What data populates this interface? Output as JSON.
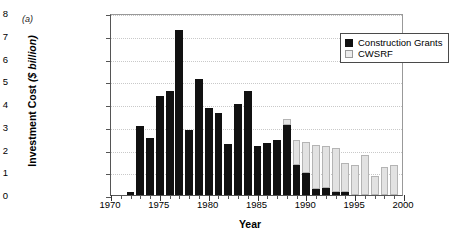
{
  "panel_label": "(a)",
  "legend": {
    "position": "top-right",
    "entries": [
      {
        "label": "Construction Grants",
        "color": "#111111",
        "swatch": "grants"
      },
      {
        "label": "CWSRF",
        "color": "#ececec",
        "swatch": "cwsrf"
      }
    ]
  },
  "axis": {
    "y_title_main": "Investment Cost",
    "y_title_unit": "($ billion)",
    "x_title": "Year"
  },
  "chart_data": {
    "type": "bar",
    "subtype": "stacked-vertical",
    "title": "",
    "xlabel": "Year",
    "ylabel": "Investment Cost ($ billion)",
    "xlim": [
      1970,
      2000
    ],
    "ylim": [
      0,
      8
    ],
    "ytick_labels": [
      "0",
      "1",
      "2",
      "3",
      "4",
      "5",
      "6",
      "7",
      "8"
    ],
    "ytick_values": [
      0,
      1,
      2,
      3,
      4,
      5,
      6,
      7,
      8
    ],
    "xtick_labels": [
      "1970",
      "1975",
      "1980",
      "1985",
      "1990",
      "1995",
      "2000"
    ],
    "xtick_values": [
      1970,
      1975,
      1980,
      1985,
      1990,
      1995,
      2000
    ],
    "x_minor_tick_step": 1,
    "grid": "horizontal-dotted",
    "legend_position": "upper right",
    "categories": [
      1972,
      1973,
      1974,
      1975,
      1976,
      1977,
      1978,
      1979,
      1980,
      1981,
      1982,
      1983,
      1984,
      1985,
      1986,
      1987,
      1988,
      1989,
      1990,
      1991,
      1992,
      1993,
      1994,
      1995,
      1996,
      1997,
      1998,
      1999
    ],
    "series": [
      {
        "name": "Construction Grants",
        "color": "#111111",
        "values": [
          0.12,
          3.05,
          2.52,
          4.35,
          4.58,
          7.27,
          2.85,
          5.12,
          3.81,
          3.6,
          2.25,
          4.0,
          4.56,
          2.14,
          2.3,
          2.44,
          3.09,
          1.31,
          0.97,
          0.28,
          0.3,
          0.15,
          0.12,
          0,
          0,
          0,
          0,
          0
        ]
      },
      {
        "name": "CWSRF",
        "color": "#ececec",
        "values": [
          0,
          0,
          0,
          0,
          0,
          0,
          0,
          0,
          0,
          0,
          0,
          0,
          0,
          0,
          0,
          0,
          0.24,
          1.12,
          1.35,
          1.94,
          1.87,
          1.9,
          1.29,
          1.33,
          1.74,
          0.85,
          1.25,
          1.33
        ]
      }
    ],
    "totals": [
      0.12,
      3.05,
      2.52,
      4.35,
      4.58,
      7.27,
      2.85,
      5.12,
      3.81,
      3.6,
      2.25,
      4.0,
      4.56,
      2.14,
      2.3,
      2.44,
      3.33,
      2.43,
      2.32,
      2.22,
      2.17,
      2.05,
      1.41,
      1.33,
      1.74,
      0.85,
      1.25,
      1.33
    ]
  }
}
